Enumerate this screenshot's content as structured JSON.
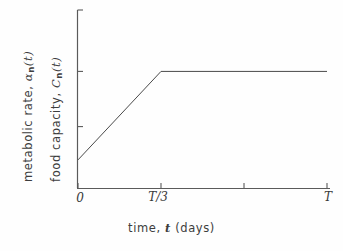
{
  "chart_data": {
    "type": "line",
    "title": "",
    "subtitle": "",
    "xlabel_parts": {
      "pre": "time, ",
      "var": "t",
      "post": " (days)"
    },
    "xlabel": "time, t (days)",
    "ylabel_line1": {
      "pre": "metabolic rate, ",
      "var": "α",
      "sub": "n",
      "post": "(t)",
      "full": "metabolic rate, αn(t)"
    },
    "ylabel_line2": {
      "pre": "food capacity, ",
      "var": "C",
      "sub": "n",
      "post": "(t)",
      "full": "food capacity, Cn(t)"
    },
    "xticks": [
      {
        "label": "0",
        "value": 0,
        "labeled": true
      },
      {
        "label": "T/3",
        "value": 0.3333,
        "labeled": true
      },
      {
        "label": "",
        "value": 0.6667,
        "labeled": false
      },
      {
        "label": "T",
        "value": 1.0,
        "labeled": true
      }
    ],
    "yticks": [
      {
        "label": "",
        "value": 1.0,
        "labeled": false
      },
      {
        "label": "",
        "value": 0.655,
        "labeled": false
      },
      {
        "label": "",
        "value": 0.345,
        "labeled": false
      }
    ],
    "xlim": [
      0,
      1.0
    ],
    "ylim": [
      0,
      1.0
    ],
    "grid": false,
    "legend": null,
    "series": [
      {
        "name": "metabolic rate / food capacity",
        "x": [
          0.0,
          0.3333,
          1.0
        ],
        "y": [
          0.158,
          0.655,
          0.655
        ],
        "color": "#4a4a4a",
        "linewidth": 1
      }
    ],
    "annotations": [],
    "axis_color": "#5a5a5a",
    "line_color": "#4a4a4a",
    "background": "#fefefe"
  }
}
